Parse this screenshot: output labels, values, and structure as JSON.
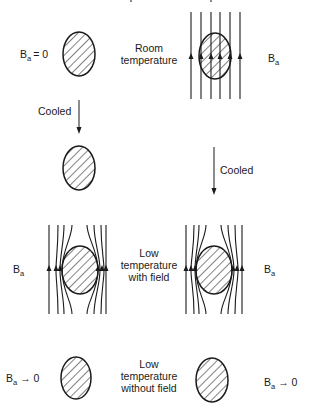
{
  "diagram": {
    "stages": {
      "room": {
        "label_line1": "Room",
        "label_line2": "temperature",
        "left_field": {
          "symbol": "B",
          "subscript": "a",
          "relation": "= 0"
        },
        "right_field": {
          "symbol": "B",
          "subscript": "a"
        }
      },
      "cooled_left": {
        "label": "Cooled"
      },
      "cooled_right": {
        "label": "Cooled"
      },
      "low_with_field": {
        "label_line1": "Low",
        "label_line2": "temperature",
        "label_line3": "with field",
        "left_field": {
          "symbol": "B",
          "subscript": "a"
        },
        "right_field": {
          "symbol": "B",
          "subscript": "a"
        }
      },
      "low_without_field": {
        "label_line1": "Low",
        "label_line2": "temperature",
        "label_line3": "without field",
        "left_field": {
          "symbol": "B",
          "subscript": "a",
          "relation": "→ 0"
        },
        "right_field": {
          "symbol": "B",
          "subscript": "a",
          "relation": "→ 0"
        }
      }
    },
    "colors": {
      "ink": "#1a1a1a",
      "background": "#ffffff"
    }
  }
}
